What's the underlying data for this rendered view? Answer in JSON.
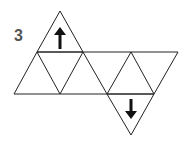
{
  "figure": {
    "number_label": "3",
    "line_color": "#222222",
    "arrows": [
      {
        "name": "up-arrow",
        "direction": "up"
      },
      {
        "name": "down-arrow",
        "direction": "down"
      }
    ]
  }
}
